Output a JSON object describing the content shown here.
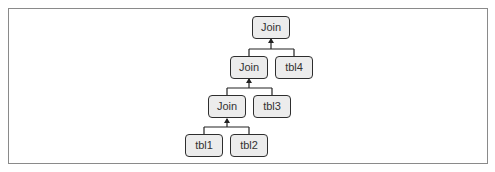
{
  "diagram": {
    "type": "join-tree",
    "colors": {
      "frame_border": "#8a8a8a",
      "node_fill": "#ececec",
      "node_border": "#2e2e2e",
      "text": "#333333",
      "connector": "#222222"
    },
    "nodes": [
      {
        "id": "join1",
        "label": "Join",
        "level": 0
      },
      {
        "id": "join2",
        "label": "Join",
        "level": 1
      },
      {
        "id": "tbl4",
        "label": "tbl4",
        "level": 1
      },
      {
        "id": "join3",
        "label": "Join",
        "level": 2
      },
      {
        "id": "tbl3",
        "label": "tbl3",
        "level": 2
      },
      {
        "id": "tbl1",
        "label": "tbl1",
        "level": 3
      },
      {
        "id": "tbl2",
        "label": "tbl2",
        "level": 3
      }
    ],
    "edges": [
      {
        "from": "join2",
        "to": "join1"
      },
      {
        "from": "tbl4",
        "to": "join1"
      },
      {
        "from": "join3",
        "to": "join2"
      },
      {
        "from": "tbl3",
        "to": "join2"
      },
      {
        "from": "tbl1",
        "to": "join3"
      },
      {
        "from": "tbl2",
        "to": "join3"
      }
    ]
  }
}
